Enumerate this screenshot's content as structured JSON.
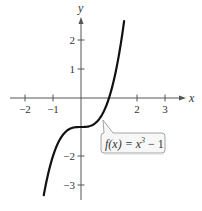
{
  "chart_data": {
    "type": "line",
    "title": "",
    "function_label": "f(x) = x³ − 1",
    "function_label_parts": {
      "lhs": "f(x) = x",
      "exp": "3",
      "rhs": " − 1"
    },
    "xlabel": "x",
    "ylabel": "y",
    "xlim": [
      -2.6,
      3.7
    ],
    "ylim": [
      -3.5,
      2.8
    ],
    "x_ticks": [
      -2,
      -1,
      2,
      3
    ],
    "x_tick_labels": [
      "−2",
      "−1",
      "2",
      "3"
    ],
    "y_ticks": [
      2,
      1,
      -2,
      -3
    ],
    "y_tick_labels": [
      "2",
      "1",
      "−2",
      "−3"
    ],
    "grid": false,
    "legend": "callout",
    "series": [
      {
        "name": "f(x) = x³ − 1",
        "domain": [
          -1.33,
          1.54
        ],
        "x": [
          -1.33,
          -1.2,
          -1.0,
          -0.8,
          -0.6,
          -0.4,
          -0.2,
          0.0,
          0.2,
          0.4,
          0.6,
          0.8,
          1.0,
          1.2,
          1.4,
          1.54
        ],
        "y": [
          -3.35,
          -2.73,
          -2.0,
          -1.51,
          -1.22,
          -1.06,
          -1.01,
          -1.0,
          -0.99,
          -0.94,
          -0.78,
          -0.49,
          0.0,
          0.73,
          1.74,
          2.65
        ]
      }
    ],
    "colors": {
      "curve": "#111111",
      "axes": "#555555",
      "callout_border": "#9a9a9a",
      "callout_fill": "#f7f7f7"
    }
  }
}
